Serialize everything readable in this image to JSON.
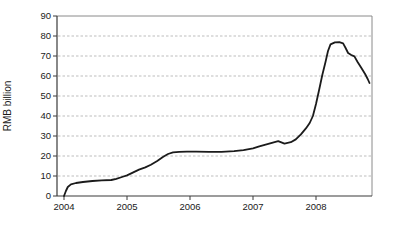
{
  "chart_data": {
    "type": "line",
    "title": "",
    "xlabel": "",
    "ylabel": "RMB billion",
    "x_ticks": [
      "2004",
      "2005",
      "2006",
      "2007",
      "2008"
    ],
    "y_ticks": [
      0,
      10,
      20,
      30,
      40,
      50,
      60,
      70,
      80,
      90
    ],
    "ylim": [
      0,
      90
    ],
    "xlim": [
      2003.89,
      2008.9
    ],
    "grid": "horizontal-dotted",
    "legend": "none",
    "series": [
      {
        "name": "RMB billion",
        "color": "#1b1b1b",
        "points": [
          [
            2004.0,
            0
          ],
          [
            2004.03,
            2.5
          ],
          [
            2004.06,
            4.5
          ],
          [
            2004.11,
            5.8
          ],
          [
            2004.19,
            6.5
          ],
          [
            2004.3,
            7.0
          ],
          [
            2004.45,
            7.5
          ],
          [
            2004.6,
            7.8
          ],
          [
            2004.75,
            8.0
          ],
          [
            2004.83,
            8.6
          ],
          [
            2004.92,
            9.5
          ],
          [
            2005.0,
            10.3
          ],
          [
            2005.1,
            11.8
          ],
          [
            2005.19,
            13.2
          ],
          [
            2005.29,
            14.3
          ],
          [
            2005.38,
            15.6
          ],
          [
            2005.48,
            17.5
          ],
          [
            2005.57,
            19.5
          ],
          [
            2005.65,
            21.0
          ],
          [
            2005.73,
            21.8
          ],
          [
            2005.83,
            22.1
          ],
          [
            2005.95,
            22.2
          ],
          [
            2006.1,
            22.2
          ],
          [
            2006.3,
            22.1
          ],
          [
            2006.5,
            22.1
          ],
          [
            2006.7,
            22.4
          ],
          [
            2006.85,
            22.9
          ],
          [
            2007.0,
            23.8
          ],
          [
            2007.1,
            24.8
          ],
          [
            2007.2,
            25.7
          ],
          [
            2007.3,
            26.6
          ],
          [
            2007.4,
            27.4
          ],
          [
            2007.5,
            26.2
          ],
          [
            2007.6,
            26.9
          ],
          [
            2007.68,
            28.3
          ],
          [
            2007.76,
            30.8
          ],
          [
            2007.84,
            33.8
          ],
          [
            2007.9,
            36.5
          ],
          [
            2007.95,
            40.0
          ],
          [
            2008.0,
            46.0
          ],
          [
            2008.05,
            53.0
          ],
          [
            2008.1,
            60.5
          ],
          [
            2008.15,
            67.0
          ],
          [
            2008.19,
            72.5
          ],
          [
            2008.23,
            75.8
          ],
          [
            2008.3,
            76.8
          ],
          [
            2008.37,
            76.9
          ],
          [
            2008.43,
            76.3
          ],
          [
            2008.47,
            74.0
          ],
          [
            2008.51,
            71.5
          ],
          [
            2008.56,
            70.5
          ],
          [
            2008.61,
            69.8
          ],
          [
            2008.66,
            67.0
          ],
          [
            2008.72,
            64.0
          ],
          [
            2008.78,
            61.0
          ],
          [
            2008.82,
            58.5
          ],
          [
            2008.85,
            56.5
          ]
        ]
      }
    ]
  },
  "style": {
    "background": "#ffffff",
    "line_color": "#1b1b1b",
    "grid_color": "#bdbdbd",
    "box_color": "#8a8a8a",
    "axis_color": "#3a3a3a",
    "text_color": "#1a1a1a"
  }
}
